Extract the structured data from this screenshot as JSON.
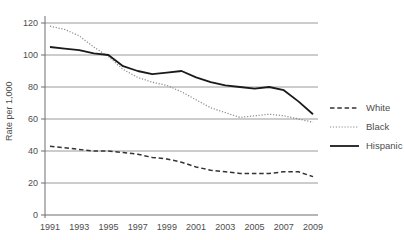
{
  "colors": {
    "gridline": "#9a9a9a",
    "axis": "#6f6f6f",
    "tick_text": "#4d4d4d"
  },
  "chart_data": {
    "type": "line",
    "title": "",
    "xlabel": "",
    "ylabel": "Rate per 1,000",
    "ylim": [
      0,
      120
    ],
    "grid": "horizontal",
    "legend_position": "right",
    "x": [
      1991,
      1992,
      1993,
      1994,
      1995,
      1996,
      1997,
      1998,
      1999,
      2000,
      2001,
      2002,
      2003,
      2004,
      2005,
      2006,
      2007,
      2008,
      2009
    ],
    "x_tick_labels": [
      "1991",
      "1993",
      "1995",
      "1997",
      "1999",
      "2001",
      "2003",
      "2005",
      "2007",
      "2009"
    ],
    "y_ticks": [
      0,
      20,
      40,
      60,
      80,
      100,
      120
    ],
    "series": [
      {
        "name": "White",
        "line_style": "dashed",
        "color": "#333333",
        "values": [
          43,
          42,
          41,
          40,
          40,
          39,
          38,
          36,
          35,
          33,
          30,
          28,
          27,
          26,
          26,
          26,
          27,
          27,
          24
        ]
      },
      {
        "name": "Black",
        "line_style": "dotted",
        "color": "#8a8a8a",
        "values": [
          118,
          116,
          112,
          105,
          99,
          91,
          86,
          83,
          81,
          77,
          72,
          67,
          64,
          61,
          62,
          63,
          62,
          60,
          58
        ]
      },
      {
        "name": "Hispanic",
        "line_style": "solid",
        "color": "#1a1a1a",
        "values": [
          105,
          104,
          103,
          101,
          100,
          93,
          90,
          88,
          89,
          90,
          86,
          83,
          81,
          80,
          79,
          80,
          78,
          71,
          63
        ]
      }
    ]
  }
}
